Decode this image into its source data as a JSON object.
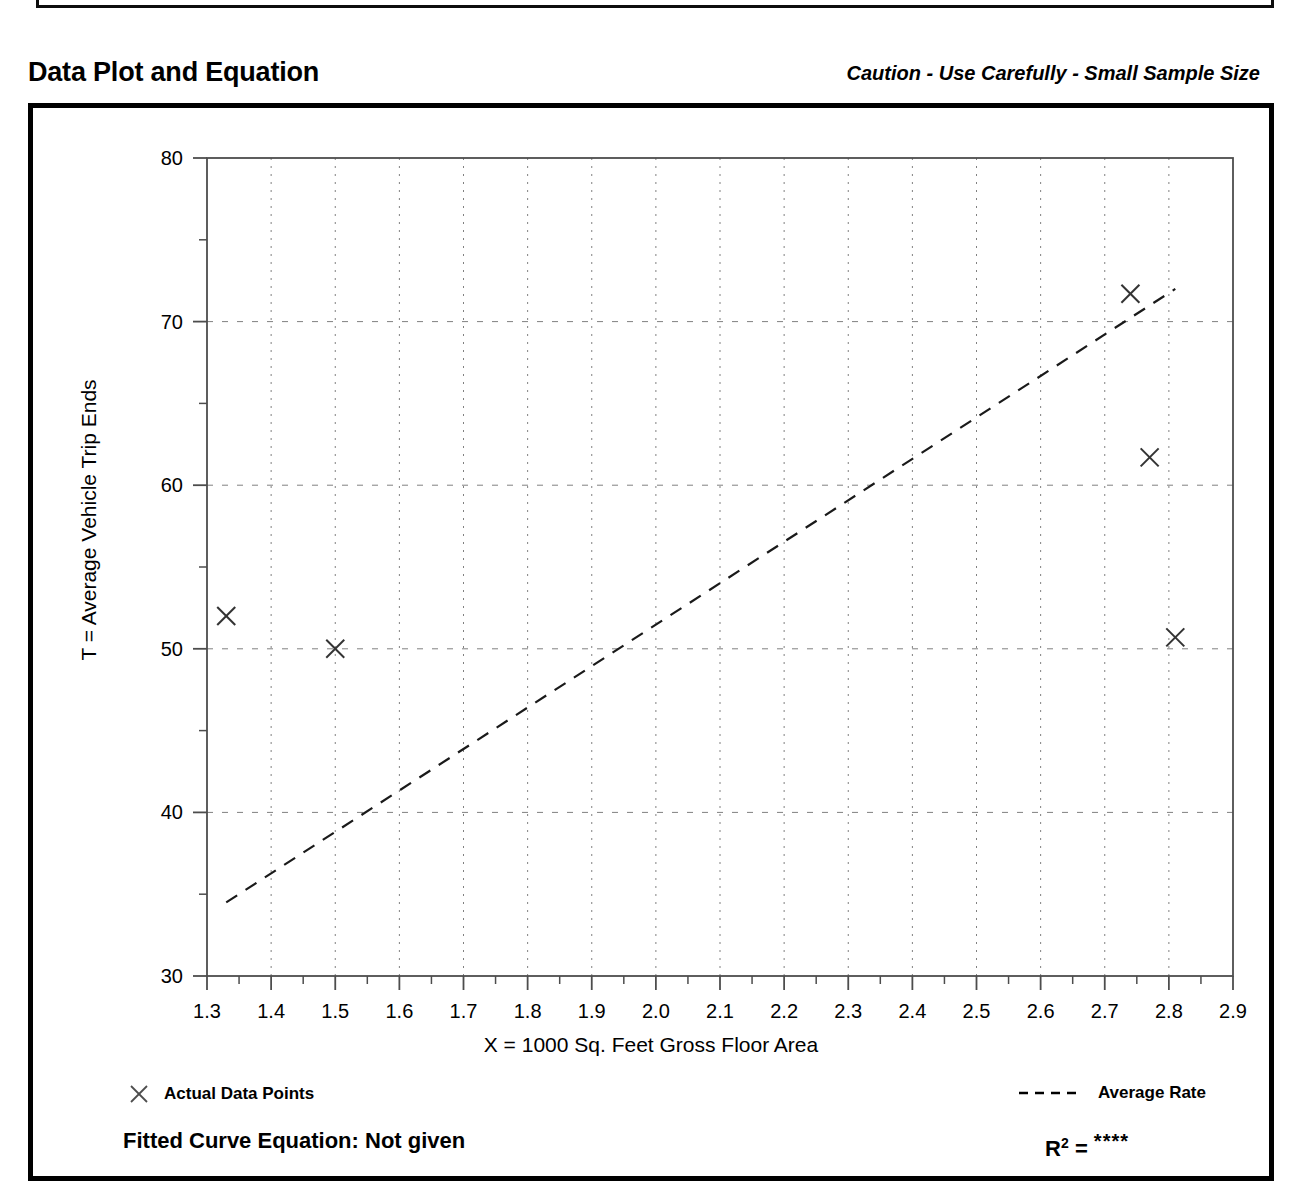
{
  "header": {
    "title": "Data Plot and Equation",
    "caution": "Caution - Use Carefully - Small Sample Size"
  },
  "footer": {
    "fitted_equation": "Fitted Curve Equation:  Not given",
    "r_label": "R",
    "r_exponent": "2",
    "r_equals": " = ",
    "r_value": "****"
  },
  "legend": {
    "points_label": "Actual Data Points",
    "rate_label": "Average Rate",
    "marker_icon": "x-marker-icon",
    "line_icon": "dashed-line-icon"
  },
  "colors": {
    "ink": "#000000",
    "grid": "#808080",
    "axis": "#4d4d4d"
  },
  "chart_data": {
    "type": "scatter",
    "title": "Data Plot and Equation",
    "xlabel": "X = 1000 Sq. Feet Gross Floor Area",
    "ylabel": "T = Average Vehicle Trip Ends",
    "xlim": [
      1.3,
      2.9
    ],
    "ylim": [
      30,
      80
    ],
    "xticks": [
      "1.3",
      "1.4",
      "1.5",
      "1.6",
      "1.7",
      "1.8",
      "1.9",
      "2.0",
      "2.1",
      "2.2",
      "2.3",
      "2.4",
      "2.5",
      "2.6",
      "2.7",
      "2.8",
      "2.9"
    ],
    "xtick_values": [
      1.3,
      1.4,
      1.5,
      1.6,
      1.7,
      1.8,
      1.9,
      2.0,
      2.1,
      2.2,
      2.3,
      2.4,
      2.5,
      2.6,
      2.7,
      2.8,
      2.9
    ],
    "yticks": [
      "30",
      "40",
      "50",
      "60",
      "70",
      "80"
    ],
    "ytick_values": [
      30,
      40,
      50,
      60,
      70,
      80
    ],
    "y_minor_values": [
      35,
      45,
      55,
      65,
      75
    ],
    "grid": true,
    "grid_style": "dotted",
    "legend_position": "below-plot",
    "series": [
      {
        "name": "Actual Data Points",
        "type": "scatter",
        "marker": "x",
        "points": [
          {
            "x": 1.33,
            "y": 52.0
          },
          {
            "x": 1.5,
            "y": 50.0
          },
          {
            "x": 2.74,
            "y": 71.7
          },
          {
            "x": 2.77,
            "y": 61.7
          },
          {
            "x": 2.81,
            "y": 50.7
          }
        ]
      },
      {
        "name": "Average Rate",
        "type": "line",
        "style": "dashed",
        "points": [
          {
            "x": 1.33,
            "y": 34.5
          },
          {
            "x": 2.81,
            "y": 72.0
          }
        ]
      }
    ]
  }
}
